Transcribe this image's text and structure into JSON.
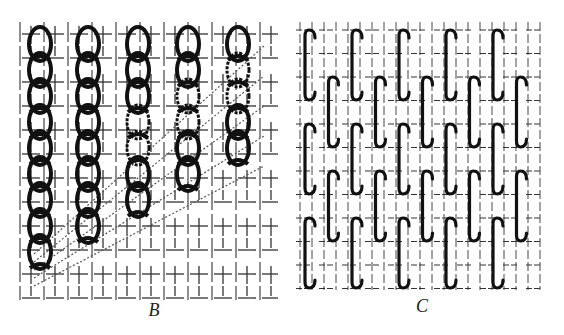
{
  "figures": [
    {
      "id": "B",
      "caption": "B",
      "description": "Chain stitch columns worked over a ground-fabric grid, with dotted diagonal threads",
      "chain_columns": 5,
      "links_per_column": [
        9,
        8,
        7,
        6,
        5
      ]
    },
    {
      "id": "C",
      "caption": "C",
      "description": "Interlocking hooked (S-shaped) stitch pattern over a ground-fabric grid",
      "stitch_columns": 10,
      "stitch_rows": 5
    }
  ],
  "colors": {
    "ink": "#111111",
    "grid": "#333333",
    "background": "#ffffff"
  }
}
